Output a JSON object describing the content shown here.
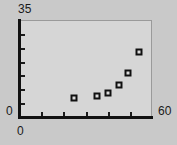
{
  "chart_data": {
    "type": "scatter",
    "title": "",
    "subtitle": "",
    "xlabel": "",
    "ylabel": "",
    "xlim": [
      0,
      60
    ],
    "ylim": [
      0,
      35
    ],
    "grid": false,
    "legend": null,
    "x_tick_labels": [
      "0",
      "60"
    ],
    "y_tick_labels": [
      "0",
      "35"
    ],
    "x_ticks_unlabeled_count": 5,
    "y_ticks_unlabeled_count": 6,
    "marker_style": "open-square",
    "points": [
      {
        "x": 25,
        "y": 7
      },
      {
        "x": 35,
        "y": 7.5
      },
      {
        "x": 40,
        "y": 8.5
      },
      {
        "x": 45,
        "y": 11.5
      },
      {
        "x": 49,
        "y": 16
      },
      {
        "x": 54,
        "y": 23.5
      }
    ],
    "series": [
      {
        "name": "series-1",
        "x": [
          25,
          35,
          40,
          45,
          49,
          54
        ],
        "values": [
          7,
          7.5,
          8.5,
          11.5,
          16,
          23.5
        ]
      }
    ],
    "colors": {
      "page_background": "#c9c9c9",
      "plot_background": "#d6d6d6",
      "axis": "#111111",
      "frame": "#9a9a9a",
      "marker_edge": "#101010",
      "marker_face": "#dcdcdc",
      "text": "#1a1a1a"
    }
  }
}
